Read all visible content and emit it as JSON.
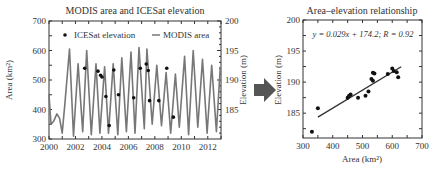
{
  "chart_data": [
    {
      "type": "line",
      "title": "MODIS area and ICESat elevation",
      "xlabel": "",
      "ylabel": "Area (km²)",
      "ylabel_right": "Elevation (m)",
      "xlim": [
        2000,
        2013
      ],
      "ylim": [
        300,
        700
      ],
      "ylim_right": [
        180,
        200
      ],
      "x_ticks": [
        2000,
        2002,
        2004,
        2006,
        2008,
        2010,
        2012
      ],
      "y_ticks": [
        300,
        400,
        500,
        600,
        700
      ],
      "y_ticks_right": [
        185,
        190,
        195,
        200
      ],
      "legend": {
        "placement": "top",
        "entries": [
          {
            "label": "ICESat elevation",
            "marker": "dot"
          },
          {
            "label": "MODIS area",
            "marker": "line"
          }
        ]
      },
      "series": [
        {
          "name": "MODIS area",
          "axis": "left",
          "x": [
            2000.0,
            2000.15,
            2000.35,
            2000.6,
            2000.8,
            2001.0,
            2001.2,
            2001.55,
            2001.85,
            2002.2,
            2002.55,
            2002.85,
            2003.2,
            2003.55,
            2003.85,
            2004.2,
            2004.5,
            2004.85,
            2005.2,
            2005.5,
            2005.85,
            2006.2,
            2006.5,
            2006.8,
            2007.2,
            2007.4,
            2007.8,
            2008.15,
            2008.5,
            2008.85,
            2009.2,
            2009.55,
            2009.85,
            2010.25,
            2010.55,
            2010.9,
            2011.25,
            2011.6,
            2011.95,
            2012.3,
            2012.65,
            2012.95
          ],
          "values": [
            450,
            350,
            360,
            385,
            370,
            320,
            420,
            605,
            310,
            555,
            325,
            600,
            315,
            555,
            320,
            545,
            320,
            555,
            315,
            575,
            325,
            595,
            320,
            610,
            335,
            605,
            350,
            550,
            345,
            525,
            320,
            520,
            340,
            580,
            315,
            600,
            340,
            570,
            320,
            550,
            325,
            545
          ]
        },
        {
          "name": "ICESat elevation",
          "axis": "right",
          "type": "scatter",
          "x": [
            2002.7,
            2003.7,
            2003.9,
            2004.0,
            2004.3,
            2004.55,
            2004.9,
            2005.25,
            2006.4,
            2006.9,
            2007.35,
            2007.5,
            2007.6,
            2008.3,
            2008.9,
            2009.4
          ],
          "values": [
            192.0,
            191.5,
            190.8,
            190.5,
            187.2,
            182.3,
            191.7,
            187.5,
            187.0,
            192.0,
            192.7,
            191.6,
            186.5,
            186.5,
            192.0,
            183.7
          ]
        }
      ]
    },
    {
      "type": "scatter",
      "title": "Area–elevation relationship",
      "xlabel": "Area (km²)",
      "ylabel": "Elevation (m)",
      "xlim": [
        300,
        700
      ],
      "ylim": [
        181,
        200
      ],
      "x_ticks": [
        300,
        400,
        500,
        600,
        700
      ],
      "y_ticks": [
        185,
        190,
        195,
        200
      ],
      "annotation": "y = 0.029x + 174.2;   R = 0.92",
      "fit_line": {
        "slope": 0.029,
        "intercept": 174.2,
        "x_range": [
          350,
          630
        ]
      },
      "series": [
        {
          "name": "observations",
          "x": [
            330,
            350,
            450,
            455,
            460,
            485,
            510,
            520,
            530,
            535,
            535,
            540,
            585,
            600,
            605,
            615,
            620
          ],
          "values": [
            182.0,
            185.8,
            187.5,
            187.8,
            188.0,
            187.5,
            187.8,
            188.5,
            190.5,
            190.2,
            191.5,
            191.4,
            191.3,
            192.2,
            191.8,
            191.6,
            190.8
          ]
        }
      ]
    }
  ],
  "arrow": {
    "direction": "right",
    "color": "#555555"
  },
  "colors": {
    "line": "#777777",
    "dot": "#111111",
    "axis": "#333333",
    "fit": "#333333"
  }
}
